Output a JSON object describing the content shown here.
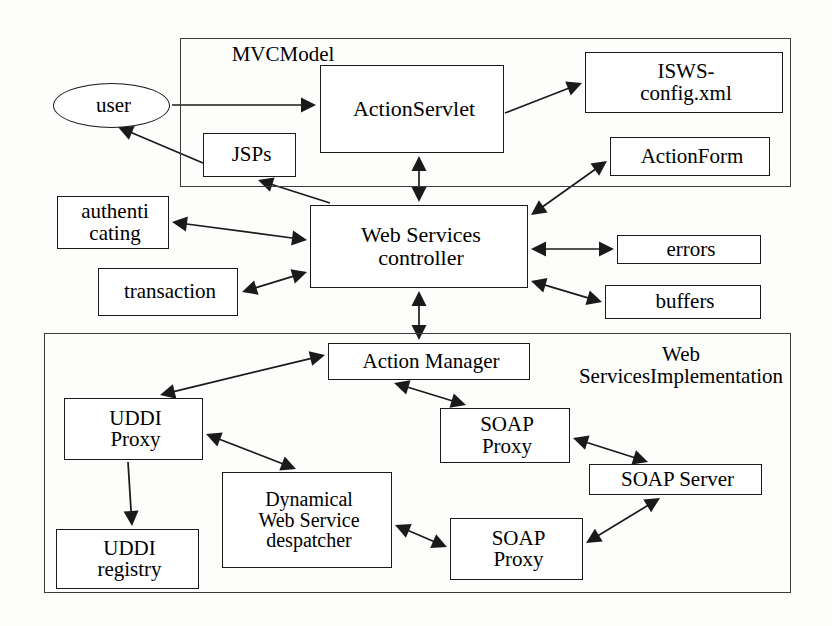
{
  "diagram": {
    "type": "block-architecture-diagram",
    "background_color": "#fdfdfc",
    "stroke_color": "#1a1a1a",
    "text_color": "#000000"
  },
  "groups": [
    {
      "id": "mvc-model",
      "label": "MVC\nModel",
      "label_line1": "MVC",
      "label_line2": "Model",
      "x": 180,
      "y": 38,
      "w": 611,
      "h": 149,
      "label_x": 218,
      "label_y": 44,
      "label_w": 130,
      "label_size": 21
    },
    {
      "id": "web-services-implementation",
      "label": "Web Services\nImplementation",
      "label_line1": "Web Services",
      "label_line2": "Implementation",
      "x": 44,
      "y": 333,
      "w": 747,
      "h": 260,
      "label_x": 572,
      "label_y": 344,
      "label_w": 218,
      "label_size": 21
    }
  ],
  "nodes": [
    {
      "id": "user",
      "label": "user",
      "shape": "ellipse",
      "x": 53,
      "y": 83,
      "w": 117,
      "h": 45,
      "font": 21
    },
    {
      "id": "jsps",
      "label": "JSPs",
      "shape": "rect",
      "x": 203,
      "y": 133,
      "w": 93,
      "h": 44,
      "font": 21
    },
    {
      "id": "action-servlet",
      "label": "ActionServlet",
      "shape": "rect",
      "x": 320,
      "y": 65,
      "w": 184,
      "h": 88,
      "font": 22
    },
    {
      "id": "isws-config",
      "label": "ISWS-\nconfig.xml",
      "shape": "rect",
      "x": 585,
      "y": 52,
      "w": 198,
      "h": 61,
      "font": 21
    },
    {
      "id": "action-form",
      "label": "ActionForm",
      "shape": "rect",
      "x": 610,
      "y": 137,
      "w": 160,
      "h": 39,
      "font": 21
    },
    {
      "id": "authenticating",
      "label": "authenti\ncating",
      "shape": "rect",
      "x": 57,
      "y": 196,
      "w": 112,
      "h": 53,
      "font": 21
    },
    {
      "id": "transaction",
      "label": "transaction",
      "shape": "rect",
      "x": 98,
      "y": 268,
      "w": 140,
      "h": 48,
      "font": 21
    },
    {
      "id": "ws-controller",
      "label": "Web Services\ncontroller",
      "shape": "rect",
      "x": 310,
      "y": 205,
      "w": 218,
      "h": 83,
      "font": 22
    },
    {
      "id": "errors",
      "label": "errors",
      "shape": "rect",
      "x": 617,
      "y": 235,
      "w": 144,
      "h": 29,
      "font": 21
    },
    {
      "id": "buffers",
      "label": "buffers",
      "shape": "rect",
      "x": 605,
      "y": 285,
      "w": 156,
      "h": 34,
      "font": 21
    },
    {
      "id": "action-manager",
      "label": "Action Manager",
      "shape": "rect",
      "x": 328,
      "y": 343,
      "w": 202,
      "h": 37,
      "font": 21
    },
    {
      "id": "uddi-proxy",
      "label": "UDDI\nProxy",
      "shape": "rect",
      "x": 64,
      "y": 398,
      "w": 139,
      "h": 62,
      "font": 21
    },
    {
      "id": "uddi-registry",
      "label": "UDDI\nregistry",
      "shape": "rect",
      "x": 56,
      "y": 529,
      "w": 143,
      "h": 60,
      "font": 21
    },
    {
      "id": "dynamical-ws",
      "label": "Dynamical\nWeb Service\ndespatcher",
      "shape": "rect",
      "x": 222,
      "y": 472,
      "w": 170,
      "h": 96,
      "font": 20
    },
    {
      "id": "soap-proxy-1",
      "label": "SOAP\nProxy",
      "shape": "rect",
      "x": 440,
      "y": 408,
      "w": 130,
      "h": 55,
      "font": 21
    },
    {
      "id": "soap-proxy-2",
      "label": "SOAP\nProxy",
      "shape": "rect",
      "x": 450,
      "y": 518,
      "w": 133,
      "h": 62,
      "font": 21
    },
    {
      "id": "soap-server",
      "label": "SOAP Server",
      "shape": "rect",
      "x": 589,
      "y": 464,
      "w": 173,
      "h": 31,
      "font": 21
    }
  ],
  "edges": [
    {
      "id": "user-to-actionservlet",
      "from": "user",
      "to": "action-servlet",
      "points": "172,105 316,105",
      "arrows": "end"
    },
    {
      "id": "jsps-to-user",
      "from": "jsps",
      "to": "user",
      "points": "203,163 118,127",
      "arrows": "end"
    },
    {
      "id": "actionservlet-to-iswsconfig",
      "from": "action-servlet",
      "to": "isws-config",
      "points": "505,113 582,83",
      "arrows": "end"
    },
    {
      "id": "actionservlet-to-controller",
      "from": "action-servlet",
      "to": "ws-controller",
      "points": "419,156 419,202",
      "arrows": "both"
    },
    {
      "id": "controller-to-jsps",
      "from": "ws-controller",
      "to": "jsps",
      "points": "330,203 258,180",
      "arrows": "end"
    },
    {
      "id": "controller-to-actionform",
      "from": "ws-controller",
      "to": "action-form",
      "points": "531,215 607,161",
      "arrows": "both"
    },
    {
      "id": "controller-to-authenticating",
      "from": "ws-controller",
      "to": "authenticating",
      "points": "307,240 172,222",
      "arrows": "both"
    },
    {
      "id": "controller-to-transaction",
      "from": "ws-controller",
      "to": "transaction",
      "points": "307,272 242,292",
      "arrows": "both"
    },
    {
      "id": "controller-to-errors",
      "from": "ws-controller",
      "to": "errors",
      "points": "531,249 614,249",
      "arrows": "both"
    },
    {
      "id": "controller-to-buffers",
      "from": "ws-controller",
      "to": "buffers",
      "points": "531,281 602,302",
      "arrows": "both"
    },
    {
      "id": "controller-to-actionmanager",
      "from": "ws-controller",
      "to": "action-manager",
      "points": "419,291 419,340",
      "arrows": "both"
    },
    {
      "id": "actionmanager-to-uddiproxy",
      "from": "action-manager",
      "to": "uddi-proxy",
      "points": "325,355 160,395",
      "arrows": "both"
    },
    {
      "id": "uddiproxy-to-uddiregistry",
      "from": "uddi-proxy",
      "to": "uddi-registry",
      "points": "128,462 132,526",
      "arrows": "end"
    },
    {
      "id": "uddiproxy-to-dynamical",
      "from": "uddi-proxy",
      "to": "dynamical-ws",
      "points": "206,434 296,469",
      "arrows": "both"
    },
    {
      "id": "actionmanager-to-soapproxy1",
      "from": "action-manager",
      "to": "soap-proxy-1",
      "points": "394,383 466,405",
      "arrows": "both"
    },
    {
      "id": "soapproxy1-to-soapserver",
      "from": "soap-proxy-1",
      "to": "soap-server",
      "points": "573,438 648,462",
      "arrows": "both"
    },
    {
      "id": "dynamical-to-soapproxy2",
      "from": "dynamical-ws",
      "to": "soap-proxy-2",
      "points": "395,525 447,547",
      "arrows": "both"
    },
    {
      "id": "soapproxy2-to-soapserver",
      "from": "soap-proxy-2",
      "to": "soap-server",
      "points": "586,543 660,498",
      "arrows": "both"
    }
  ]
}
